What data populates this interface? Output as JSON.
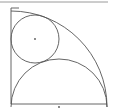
{
  "diagram": {
    "type": "geometry",
    "colors": {
      "stroke": "#555555",
      "top_rule": "#9a9a9a",
      "background": "#ffffff"
    },
    "top_rule": {
      "x1": 0,
      "y1": 2,
      "x2": 108,
      "y2": 2
    },
    "square": {
      "x": 11,
      "y": 8,
      "size": 96
    },
    "quarter_arc": {
      "cx": 11,
      "cy": 107,
      "r": 96
    },
    "semicircle": {
      "cx": 59,
      "cy": 107,
      "r": 48
    },
    "small_circle": {
      "cx": 35,
      "cy": 39,
      "r": 24
    },
    "center_dots": [
      {
        "cx": 35,
        "cy": 39
      },
      {
        "cx": 59,
        "cy": 107
      }
    ]
  }
}
